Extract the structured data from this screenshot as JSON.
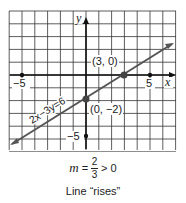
{
  "chart_data": {
    "type": "line",
    "title": "",
    "xlabel": "x",
    "ylabel": "y",
    "xlim": [
      -6,
      7
    ],
    "ylim": [
      -6,
      5
    ],
    "grid": true,
    "tick_labels": {
      "x": [
        "-5",
        "5"
      ],
      "y": [
        "-5"
      ]
    },
    "series": [
      {
        "name": "2x-3y=6",
        "equation": "2x-3y=6",
        "x": [
          -6,
          7
        ],
        "y": [
          -6,
          2.667
        ],
        "slope": 0.6667,
        "intercept": -2
      }
    ],
    "points": [
      {
        "x": 3,
        "y": 0,
        "label": "(3, 0)"
      },
      {
        "x": 0,
        "y": -2,
        "label": "(0, -2)"
      }
    ],
    "tick_marks": [
      {
        "x": -5,
        "y": 0
      },
      {
        "x": 5,
        "y": 0
      },
      {
        "x": 0,
        "y": -5
      }
    ],
    "annotations": [
      "m = 2/3 > 0",
      "Line “rises”"
    ]
  },
  "labels": {
    "x_axis": "x",
    "y_axis": "y",
    "x_neg5": "−5",
    "x_pos5": "5",
    "y_neg5": "−5",
    "line_eq": "2x−3y=6",
    "pt_x_int": "(3, 0)",
    "pt_y_int": "(0, −2)"
  },
  "caption": {
    "m": "m",
    "eq": "=",
    "num": "2",
    "den": "3",
    "rest": "> 0",
    "note": "Line “rises”"
  },
  "colors": {
    "line": "#555555",
    "grid": "#333333",
    "axis": "#111111",
    "point": "#444444"
  }
}
